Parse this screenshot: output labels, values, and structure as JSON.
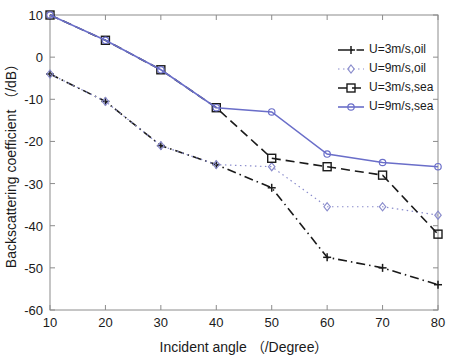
{
  "chart_data": {
    "type": "line",
    "title": "",
    "subtitle": "",
    "xlabel": "Incident angle （/Degree）",
    "ylabel": "Backscattering coefficient （/dB）",
    "x": [
      10,
      20,
      30,
      40,
      50,
      60,
      70,
      80
    ],
    "xlim": [
      10,
      80
    ],
    "ylim": [
      -60,
      10
    ],
    "xticks": [
      10,
      20,
      30,
      40,
      50,
      60,
      70,
      80
    ],
    "yticks": [
      10,
      0,
      -10,
      -20,
      -30,
      -40,
      -50,
      -60
    ],
    "xtick_labels": [
      "10",
      "20",
      "30",
      "40",
      "50",
      "60",
      "70",
      "80"
    ],
    "ytick_labels": [
      "10",
      "0",
      "-10",
      "-20",
      "-30",
      "-40",
      "-50",
      "-60"
    ],
    "grid": false,
    "legend_position": "upper right",
    "series": [
      {
        "name": "U=3m/s,oil",
        "values": [
          -4,
          -10.5,
          -21,
          -25.5,
          -31,
          -47.5,
          -50,
          -54
        ],
        "color": "#1a1a1a",
        "linestyle": "dashdot",
        "marker": "plus"
      },
      {
        "name": "U=9m/s,oil",
        "values": [
          -4,
          -10.5,
          -21,
          -25.5,
          -26,
          -35.5,
          -35.5,
          -37.5
        ],
        "color": "#8a8ccc",
        "linestyle": "dotted",
        "marker": "diamond"
      },
      {
        "name": "U=3m/s,sea",
        "values": [
          10,
          4,
          -3,
          -12,
          -24,
          -26,
          -28,
          -42
        ],
        "color": "#1a1a1a",
        "linestyle": "dashed",
        "marker": "square"
      },
      {
        "name": "U=9m/s,sea",
        "values": [
          10,
          4,
          -3,
          -12,
          -13,
          -23,
          -25,
          -26
        ],
        "color": "#6a6ec9",
        "linestyle": "solid",
        "marker": "circle"
      }
    ]
  },
  "axes": {
    "frame_color": "#8c8c8c",
    "background": "#ffffff"
  }
}
